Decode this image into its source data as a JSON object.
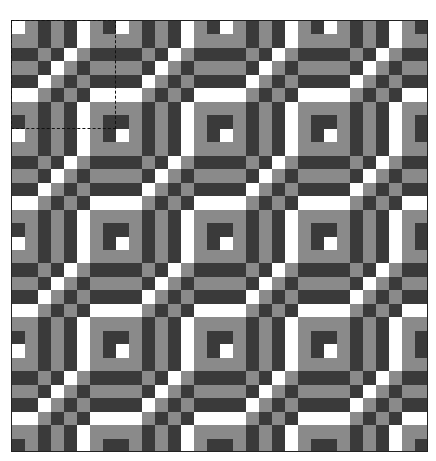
{
  "pattern": {
    "colors": {
      "W": "#ffffff",
      "G": "#8a8a8a",
      "D": "#3a3a3a"
    },
    "tile": [
      [
        "W",
        "G",
        "D",
        "G",
        "D",
        "W",
        "G",
        "D"
      ],
      [
        "G",
        "G",
        "D",
        "G",
        "D",
        "W",
        "G",
        "G"
      ],
      [
        "D",
        "D",
        "G",
        "D",
        "W",
        "G",
        "D",
        "D"
      ],
      [
        "G",
        "G",
        "D",
        "W",
        "G",
        "D",
        "G",
        "G"
      ],
      [
        "D",
        "D",
        "W",
        "G",
        "D",
        "G",
        "D",
        "D"
      ],
      [
        "W",
        "W",
        "G",
        "D",
        "G",
        "D",
        "W",
        "W"
      ],
      [
        "G",
        "G",
        "D",
        "G",
        "D",
        "W",
        "G",
        "G"
      ],
      [
        "D",
        "G",
        "D",
        "G",
        "D",
        "W",
        "G",
        "D"
      ]
    ],
    "repeat_x": 4,
    "repeat_y": 4
  },
  "selection": {
    "tile_col": 0,
    "tile_row": 0,
    "style": "dashed"
  }
}
